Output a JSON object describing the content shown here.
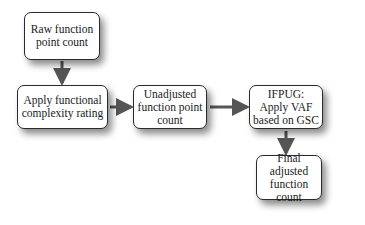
{
  "diagram": {
    "type": "flowchart",
    "nodes": [
      {
        "id": "raw",
        "label": "Raw function point count"
      },
      {
        "id": "complexity",
        "label": "Apply functional complexity rating"
      },
      {
        "id": "unadjusted",
        "label": "Unadjusted function point count"
      },
      {
        "id": "vaf",
        "label": "IFPUG: Apply VAF based on GSC"
      },
      {
        "id": "final",
        "label": "Final adjusted function count"
      }
    ],
    "edges": [
      {
        "from": "raw",
        "to": "complexity"
      },
      {
        "from": "complexity",
        "to": "unadjusted"
      },
      {
        "from": "unadjusted",
        "to": "vaf"
      },
      {
        "from": "vaf",
        "to": "final"
      }
    ],
    "colors": {
      "border": "#2a2a2a",
      "arrow": "#555555",
      "fill": "#ffffff"
    }
  }
}
